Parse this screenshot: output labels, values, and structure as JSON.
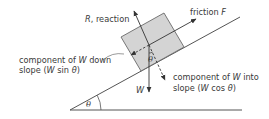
{
  "diagram": {
    "type": "inclined-plane-forces",
    "colors": {
      "line": "#555555",
      "block_fill": "#d4d4d4",
      "block_stroke": "#6a6a6a",
      "text": "#3a3a3a",
      "background": "#ffffff"
    },
    "labels": {
      "reaction": {
        "prefix": "R",
        "suffix": ", reaction"
      },
      "friction": {
        "prefix": "friction ",
        "var": "F"
      },
      "weight": "W",
      "down_slope": {
        "line1_a": "component of ",
        "line1_var": "W",
        "line1_b": " down",
        "line2_a": "slope (",
        "line2_var": "W",
        "line2_b": " sin  ",
        "line2_theta": "θ",
        "line2_c": ")"
      },
      "into_slope": {
        "line1_a": "component of ",
        "line1_var": "W",
        "line1_b": " into",
        "line2_a": "slope (",
        "line2_var": "W",
        "line2_b": " cos ",
        "line2_theta": "θ",
        "line2_c": ")"
      },
      "angle_slope": "θ",
      "angle_block": "θ"
    }
  }
}
